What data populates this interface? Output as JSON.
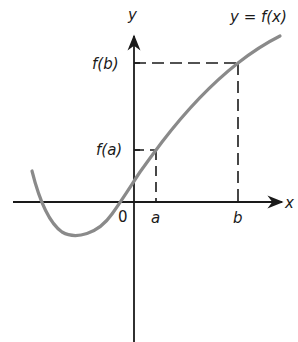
{
  "diagram": {
    "title": "",
    "type": "function graph",
    "axes": {
      "x_label": "x",
      "y_label": "y",
      "origin_label": "0"
    },
    "curve_label": "y = f(x)",
    "points": {
      "a_label": "a",
      "b_label": "b",
      "fa_label": "f(a)",
      "fb_label": "f(b)"
    },
    "colors": {
      "axis": "#1a1a1a",
      "curve": "#8a8a8a",
      "dashed": "#1a1a1a",
      "background": "#ffffff"
    }
  }
}
